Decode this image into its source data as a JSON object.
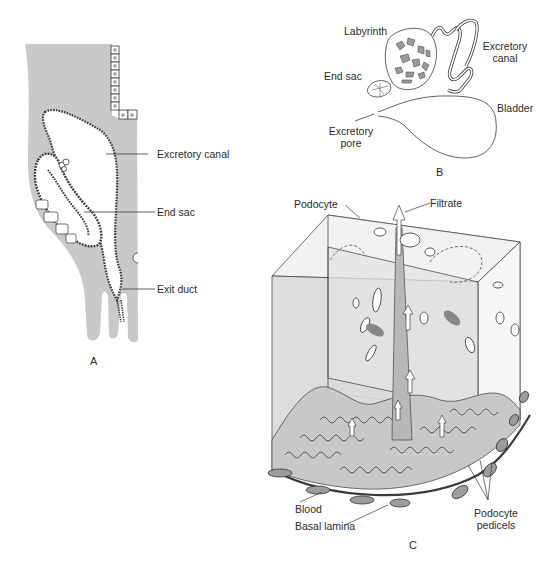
{
  "figure": {
    "panel_a": {
      "panel_label": "A",
      "labels": {
        "excretory_canal": "Excretory canal",
        "end_sac": "End sac",
        "exit_duct": "Exit duct"
      }
    },
    "panel_b": {
      "panel_label": "B",
      "labels": {
        "labyrinth": "Labyrinth",
        "end_sac": "End sac",
        "excretory_canal_line1": "Excretory",
        "excretory_canal_line2": "canal",
        "bladder": "Bladder",
        "excretory_pore_line1": "Excretory",
        "excretory_pore_line2": "pore"
      }
    },
    "panel_c": {
      "panel_label": "C",
      "labels": {
        "podocyte": "Podocyte",
        "filtrate": "Filtrate",
        "blood": "Blood",
        "basal_lamina": "Basal lamina",
        "podocyte_pedicels_line1": "Podocyte",
        "podocyte_pedicels_line2": "pedicels"
      }
    },
    "colors": {
      "tissue_gray": "#c9c9c9",
      "cube_face": "#dcdcdc",
      "line": "#3a3a3a",
      "background": "#ffffff"
    }
  }
}
